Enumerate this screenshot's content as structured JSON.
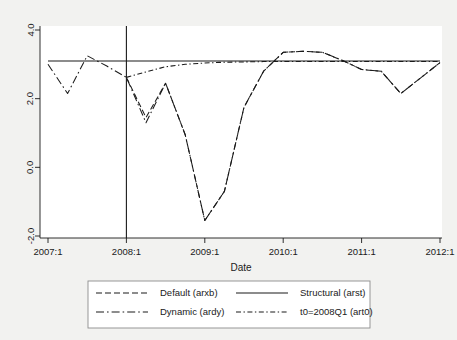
{
  "figure": {
    "background_color": "#f2f2f0",
    "plot_background_color": "#ffffff",
    "line_color": "#1a1a1a",
    "legend_border_color": "#8d8d8d"
  },
  "axis": {
    "x_title": "Date",
    "y_title": "",
    "x_ticks": [
      "2007:1",
      "2008:1",
      "2009:1",
      "2010:1",
      "2011:1",
      "2012:1"
    ],
    "y_ticks": [
      "4.0",
      "2.0",
      "0.0",
      "-2.0"
    ]
  },
  "legend": {
    "entries": [
      {
        "label": "Default (arxb)",
        "style": "dashed"
      },
      {
        "label": "Structural (arst)",
        "style": "solid"
      },
      {
        "label": "Dynamic (ardy)",
        "style": "dash-dot"
      },
      {
        "label": "t0=2008Q1 (art0)",
        "style": "dash-dot-fine"
      }
    ]
  },
  "chart_data": {
    "type": "line",
    "title": "",
    "xlabel": "Date",
    "ylabel": "",
    "xlim": [
      "2007:1",
      "2012:1"
    ],
    "ylim": [
      -2.0,
      4.0
    ],
    "yticks": [
      -2.0,
      0.0,
      2.0,
      4.0
    ],
    "xticks": [
      "2007:1",
      "2008:1",
      "2009:1",
      "2010:1",
      "2011:1",
      "2012:1"
    ],
    "grid": false,
    "legend_position": "below-axes",
    "annotations": [
      {
        "type": "vline",
        "x": "2008:1",
        "label": "t0 = 2008Q1 forecast origin"
      }
    ],
    "x": [
      "2007:1",
      "2007:2",
      "2007:3",
      "2007:4",
      "2008:1",
      "2008:2",
      "2008:3",
      "2008:4",
      "2009:1",
      "2009:2",
      "2009:3",
      "2009:4",
      "2010:1",
      "2010:2",
      "2010:3",
      "2010:4",
      "2011:1",
      "2011:2",
      "2011:3",
      "2011:4",
      "2012:1"
    ],
    "series": [
      {
        "name": "Structural (arst)",
        "style": "solid",
        "constant": true,
        "values": [
          3.1,
          3.1,
          3.1,
          3.1,
          3.1,
          3.1,
          3.1,
          3.1,
          3.1,
          3.1,
          3.1,
          3.1,
          3.1,
          3.1,
          3.1,
          3.1,
          3.1,
          3.1,
          3.1,
          3.1,
          3.1
        ]
      },
      {
        "name": "Dynamic (ardy)",
        "style": "dash-dot",
        "values": [
          3.0,
          2.15,
          3.25,
          2.95,
          2.62,
          1.3,
          2.45,
          0.95,
          -1.55,
          -0.7,
          1.75,
          2.8,
          3.35,
          3.38,
          3.35,
          3.12,
          2.85,
          2.8,
          2.15,
          2.6,
          3.05
        ]
      },
      {
        "name": "t0=2008Q1 (art0)",
        "style": "dash-dot-fine",
        "values": [
          null,
          null,
          null,
          null,
          2.62,
          2.78,
          2.93,
          3.0,
          3.04,
          3.06,
          3.07,
          3.08,
          3.08,
          3.08,
          3.08,
          3.08,
          3.08,
          3.08,
          3.08,
          3.08,
          3.08
        ]
      },
      {
        "name": "Default (arxb)",
        "style": "dashed",
        "values": [
          null,
          null,
          null,
          null,
          2.62,
          1.45,
          2.45,
          0.95,
          -1.55,
          -0.7,
          1.75,
          2.8,
          3.35,
          3.38,
          3.35,
          3.12,
          2.85,
          2.8,
          2.15,
          2.6,
          3.05
        ]
      }
    ]
  }
}
